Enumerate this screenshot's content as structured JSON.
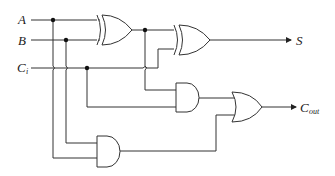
{
  "diagram": {
    "inputs": [
      {
        "id": "A",
        "label": "A",
        "sub": ""
      },
      {
        "id": "B",
        "label": "B",
        "sub": ""
      },
      {
        "id": "Ci",
        "label": "C",
        "sub": "i"
      }
    ],
    "outputs": [
      {
        "id": "S",
        "label": "S",
        "sub": ""
      },
      {
        "id": "Cout",
        "label": "C",
        "sub": "out"
      }
    ],
    "gates": [
      {
        "id": "xor1",
        "type": "XOR",
        "inputs": [
          "A",
          "B"
        ]
      },
      {
        "id": "xor2",
        "type": "XOR",
        "inputs": [
          "xor1",
          "Ci"
        ],
        "output": "S"
      },
      {
        "id": "and1",
        "type": "AND",
        "inputs": [
          "xor1",
          "Ci"
        ]
      },
      {
        "id": "and2",
        "type": "AND",
        "inputs": [
          "A",
          "B"
        ]
      },
      {
        "id": "or1",
        "type": "OR",
        "inputs": [
          "and1",
          "and2"
        ],
        "output": "Cout"
      }
    ]
  }
}
